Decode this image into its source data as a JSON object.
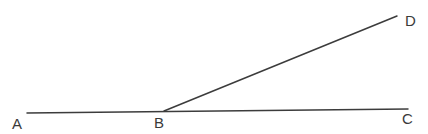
{
  "diagram": {
    "type": "geometry-angle",
    "points": {
      "A": {
        "label": "A",
        "x": 27,
        "y": 113
      },
      "B": {
        "label": "B",
        "x": 164,
        "y": 111
      },
      "C": {
        "label": "C",
        "x": 408,
        "y": 109
      },
      "D": {
        "label": "D",
        "x": 397,
        "y": 16
      }
    },
    "segments": [
      {
        "from": "A",
        "to": "C"
      },
      {
        "from": "B",
        "to": "D"
      }
    ],
    "labels": {
      "A": {
        "text": "A",
        "x": 12,
        "y": 129
      },
      "B": {
        "text": "B",
        "x": 154,
        "y": 128
      },
      "C": {
        "text": "C",
        "x": 402,
        "y": 124
      },
      "D": {
        "text": "D",
        "x": 405,
        "y": 26
      }
    },
    "colors": {
      "line": "#3c3c3c",
      "text": "#3a3a3a",
      "background": "#ffffff"
    }
  }
}
